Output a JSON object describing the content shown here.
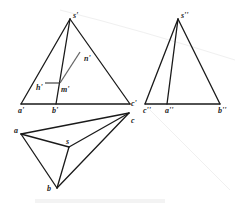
{
  "diagram": {
    "type": "orthographic-projection-of-pyramid",
    "views": {
      "front": {
        "labels": {
          "apex": "s'",
          "a": "a'",
          "b": "b'",
          "c": "c'",
          "m": "m'",
          "n": "n'",
          "h": "h'"
        },
        "points": {
          "s": [
            70,
            19
          ],
          "a": [
            21,
            104
          ],
          "b": [
            56,
            104
          ],
          "c": [
            130,
            104
          ],
          "m": [
            60,
            83
          ],
          "n": [
            80,
            52
          ],
          "h": [
            45,
            83
          ]
        }
      },
      "side": {
        "labels": {
          "apex": "s''",
          "c": "c''",
          "a": "a''",
          "b": "b''"
        },
        "points": {
          "s": [
            178,
            19
          ],
          "c": [
            145,
            104
          ],
          "a": [
            167,
            104
          ],
          "b": [
            220,
            104
          ]
        }
      },
      "top": {
        "labels": {
          "a": "a",
          "b": "b",
          "c": "c",
          "s": "s"
        },
        "points": {
          "a": [
            21,
            134
          ],
          "s": [
            69,
            147
          ],
          "c": [
            129,
            113
          ],
          "b": [
            57,
            188
          ]
        }
      }
    },
    "colors": {
      "line": "#1a1a1a",
      "construction": "#666666",
      "text": "#222222"
    }
  }
}
